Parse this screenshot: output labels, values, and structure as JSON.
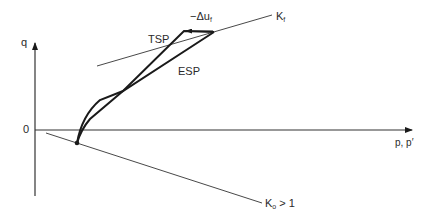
{
  "diagram": {
    "type": "stress-path",
    "axes": {
      "y_label": "q",
      "x_label": "p, p′",
      "origin_label": "0"
    },
    "lines": {
      "kf_label_main": "K",
      "kf_label_sub": "f",
      "k0_label_main": "K",
      "k0_label_sub": "o",
      "k0_label_rest": " > 1"
    },
    "paths": {
      "tsp_label": "TSP",
      "esp_label": "ESP"
    },
    "annotation": {
      "pore_pressure_label_main": "−Δu",
      "pore_pressure_label_sub": "f"
    },
    "colors": {
      "ink": "#1a1a1a",
      "thin_line": "#333333",
      "background": "#ffffff"
    }
  }
}
